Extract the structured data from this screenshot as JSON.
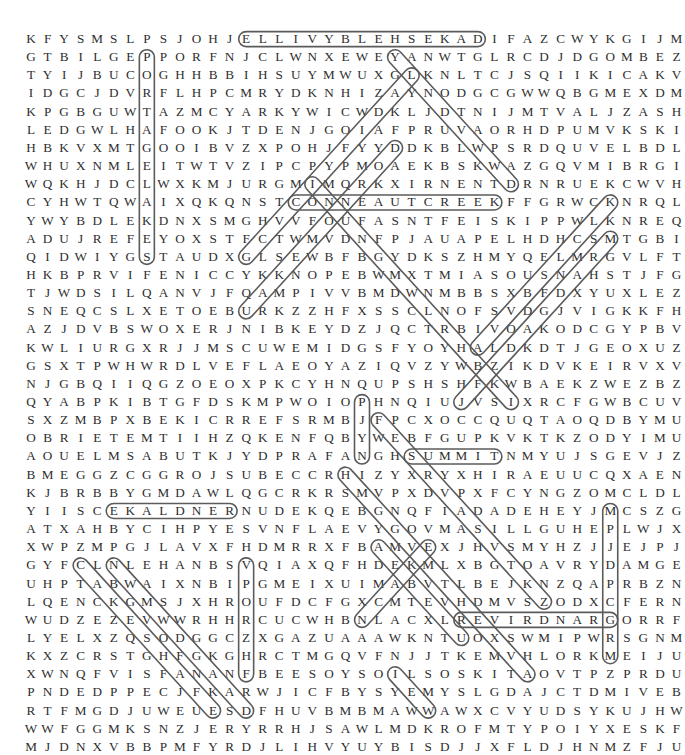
{
  "puzzle": {
    "kind": "word-search-grid",
    "rows": 36,
    "cols": 33,
    "letter_color": "#2e2e2e",
    "mark_color": "#5b5b5b",
    "background": "#ffffff",
    "grid": [
      "KFYSMSLPSJOHJELLIVYBLEHSEKADIFAZCWYKGIJM",
      "GTBILGEPPORFNJCLWNXEWEYANWTGLRCDJDGOMBEZ",
      "TYIJBUCOGHHBBIHSUYMWUXGLKNLTCJSQIIKICAKV",
      "IDGCJDVRFLHPCMRYDKNHIZAYNODGCGWWQBGMEXDM",
      "KPGBGUWTAZMCYARKYWICWDKLJDTNIJMTVALJZASH",
      "LEDGWLHAFOOKJTDENJGOIAFPRUVAORHDPUMVKSKI",
      "HBKVXMTGOOIBVZXPOHJFYYDDKBLWPSRDQUVELBDL",
      "WHUXNMLEITWTVZIPCPYPMOAEKBSKWAZGQVMIBRGI",
      "WQKHJDCLWXKMJURGMIMQRKXIRNENTDRNRUEKCWVH",
      "CYHWTQWAIXQKQNSTCONNEAUTCREEKFFGRWCKNRQL",
      "YWYBDLEKDNXSMGHVVFOUFASNTFEISKIPPWLKNREQ",
      "ADUJREFEYOXSTFCTWMVDNFPJAUAPELHDHCSMTGBI",
      "QIDWIYGSTAUDXGLSEWBFBGYDKSZHMYQELMRGVLFT",
      "HKBPRVIFENICCYKKNOPEBWMXTMIASOUSNAHSTJFG",
      "TJWDSILQANVJFQAMPIVVBMDWNMBBSXBFDXYUXLEZ",
      "SNEQCSLXETOEBURKZZHFXSSCLNOFSVDGJVIGKKFH",
      "AZJDVBSWOXERJNIBKEYDZJQCTRBIVOAKODCGYPBV",
      "KWLIURGXRJJMSCUWEMIDGSFYOYHALDKDTJGEOXUZ",
      "GSXTPWHWRDLVEFLAEOYAZIQVZYWBZIKDVKEIRVXV",
      "NJGBQIIQGZOEOXPKCYHNQUPSHSHFKWBAEKZWEZBZ",
      "QYABPKIBTGFDSKMPWOIOPHNQIUJVSIXRCFGWBCUV",
      "SXZMBPXBEKICRREFSRMBJFPCXOCCQUQTAOQDBYMU",
      "OBRIETEMTIIHZQKENFQBYWEBFGUPKVKTKZODYIMU",
      "AOUELMSABUTKJYDPRAFANGHSUMMITNMYUJSGEVJZ",
      "BMEGGZCGGROJSUBECCRHIZYXRYXHIRAEUUCQXAEN",
      "KJBRBBYGMDAWLQGCRKRSMVPXDVPXFCYNGZOMCLDL",
      "YIISCEKALDNERNUDEKQEBGNQFIADADEHEYJMCSZG",
      "ATXAHBYCIHPYESVNFLAEVYGOVMASILLGUHEPLWJX",
      "XWPZMPGJLAVXFHDMRRXFBAMVEXJHVSMYHZJJEJPJ",
      "GYFCLNLEHANBSVQIAXQFHDEKMLXBGTOAVRYDAMGE",
      "UHPTABWAIXNBIPGMEIXUIMABVTLBEJKNZQAPRBZN",
      "LQENCKGMSJXHROUFDCFGXCMTEVHDMVSZODXCFERN",
      "WUDZEZEVWWRHHRCUCWHBNLACXLREVIRDNARGORRF",
      "LYELXZQSODGGCZXGAZUAAAWKNTUOXSWMIPWRSGNM",
      "KXZCRSTGHFGKGHRCTMGQVFNJJTKEMVHLORKMEIJU",
      "XWNQFVISFANANFBEESOYSOILSOSKITAOVTPZPRDU",
      "PNDEDPPECJFKARWJICFBYSYEMYSLGDAJCTDMIVEB",
      "RTFMGDJUWEUESDFHUVBMBMAWWAWXCVYUDSYKUJHW",
      "WWFGGMKSNZJERYRRHJSAWLMDKROFMTYPOIYXESKF",
      "MJDNXVBBPMFYRDJLIHVYUYBISDJJXFLDJHNMZFJU"
    ],
    "found_words": [
      {
        "text": "LAKESHELBYVILLE",
        "display": "ELLIVYBLEHSEKAD",
        "orientation": "horizontal-reversed",
        "row": 1,
        "col_start": 14,
        "col_end": 28
      },
      {
        "text": "PORTAGELAKES",
        "display": "PORTAGELAKES",
        "orientation": "vertical-down",
        "col": 8,
        "row_start": 2,
        "row_end": 13
      },
      {
        "text": "CONNEAUTCREEK",
        "display": "CONNEAUTCREEK",
        "orientation": "horizontal",
        "row": 10,
        "col_start": 17,
        "col_end": 29
      },
      {
        "text": "RENDLAKE",
        "display": "EKALDNER",
        "orientation": "horizontal-reversed",
        "row": 27,
        "col_start": 6,
        "col_end": 13
      },
      {
        "text": "SUMMIT",
        "display": "SUMMIT",
        "orientation": "horizontal",
        "row": 24,
        "col_start": 24,
        "col_end": 29
      },
      {
        "text": "GRANDRIVER",
        "display": "REVIRDNARG",
        "orientation": "horizontal-reversed",
        "row": 33,
        "col_start": 27,
        "col_end": 36
      },
      {
        "text": "CLEARFORK",
        "display": "CLEARFORK",
        "orientation": "vertical-down",
        "col": 36,
        "row_start": 27,
        "row_end": 35
      },
      {
        "text": "SHABBONA",
        "display": "SHABBONA",
        "orientation": "vertical-up",
        "col": 21,
        "row_start": 24,
        "row_end": 21
      },
      {
        "text": "CHRISTINA",
        "display": "SIRHCG",
        "orientation": "vertical-down",
        "col": 14,
        "row_start": 30,
        "row_end": 36
      },
      {
        "text": "DIAGONAL-NE-1",
        "display": "diagonal",
        "orientation": "diagonal-up-right",
        "row_start": 13,
        "col_start": 14,
        "row_end": 3,
        "col_end": 24
      },
      {
        "text": "DIAGONAL-NE-2",
        "display": "diagonal",
        "orientation": "diagonal-up-right",
        "row_start": 16,
        "col_start": 14,
        "row_end": 7,
        "col_end": 23
      },
      {
        "text": "DIAGONAL-NE-3",
        "display": "diagonal",
        "orientation": "diagonal-up-right",
        "row_start": 21,
        "col_start": 27,
        "row_end": 12,
        "col_end": 36
      },
      {
        "text": "DIAGONAL-NE-4",
        "display": "diagonal",
        "orientation": "diagonal-up-right",
        "row_start": 18,
        "col_start": 28,
        "row_end": 10,
        "col_end": 36
      },
      {
        "text": "DIAGONAL-SE-1",
        "display": "diagonal",
        "orientation": "diagonal-down-right",
        "row_start": 9,
        "col_start": 18,
        "row_end": 21,
        "col_end": 30
      },
      {
        "text": "DIAGONAL-SE-2",
        "display": "diagonal",
        "orientation": "diagonal-down-right",
        "row_start": 2,
        "col_start": 23,
        "row_end": 9,
        "col_end": 30
      },
      {
        "text": "DIAGONAL-SE-3",
        "display": "diagonal",
        "orientation": "diagonal-down-right",
        "row_start": 22,
        "col_start": 22,
        "row_end": 32,
        "col_end": 32
      },
      {
        "text": "DIAGONAL-SE-4",
        "display": "diagonal",
        "orientation": "diagonal-down-right",
        "row_start": 25,
        "col_start": 20,
        "row_end": 36,
        "col_end": 31
      },
      {
        "text": "DIAGONAL-SE-5",
        "display": "diagonal",
        "orientation": "diagonal-down-right",
        "row_start": 30,
        "col_start": 4,
        "row_end": 38,
        "col_end": 12
      },
      {
        "text": "DIAGONAL-SE-6",
        "display": "diagonal",
        "orientation": "diagonal-down-right",
        "row_start": 30,
        "col_start": 6,
        "row_end": 38,
        "col_end": 14
      },
      {
        "text": "DIAGONAL-SE-7",
        "display": "diagonal",
        "orientation": "diagonal-down-right",
        "row_start": 29,
        "col_start": 22,
        "row_end": 34,
        "col_end": 27
      },
      {
        "text": "DIAGONAL-SE-8",
        "display": "diagonal",
        "orientation": "diagonal-down-right",
        "row_start": 36,
        "col_start": 23,
        "row_end": 38,
        "col_end": 25
      },
      {
        "text": "DIAGONAL-NE-5",
        "display": "diagonal",
        "orientation": "diagonal-up-right",
        "row_start": 33,
        "col_start": 21,
        "row_end": 29,
        "col_end": 25
      }
    ]
  },
  "geometry": {
    "origin_x": 31,
    "origin_y": 30,
    "cell_w": 16.55,
    "cell_h": 18.15,
    "font_size_px": 13.2
  }
}
